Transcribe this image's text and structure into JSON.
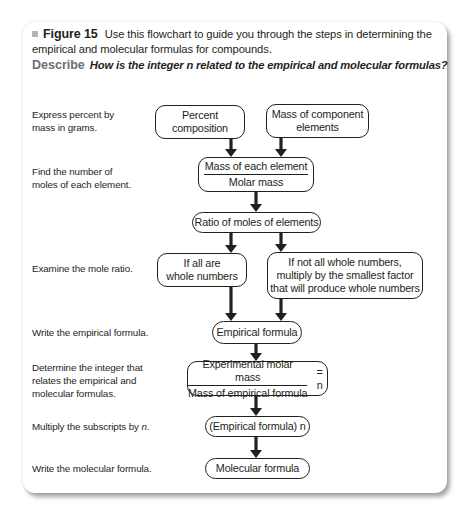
{
  "caption": {
    "figure_label": "Figure 15",
    "text": "Use this flowchart to guide you through the steps in determining the empirical and molecular formulas for compounds.",
    "describe_label": "Describe",
    "describe_question": "How is the integer n related to the empirical and molecular formulas?"
  },
  "steps": [
    {
      "line1": "Express percent by",
      "line2": "mass in grams.",
      "line3": ""
    },
    {
      "line1": "Find the number of",
      "line2": "moles of each element.",
      "line3": ""
    },
    {
      "line1": "Examine the mole ratio.",
      "line2": "",
      "line3": ""
    },
    {
      "line1": "Write the empirical formula.",
      "line2": "",
      "line3": ""
    },
    {
      "line1": "Determine the integer that",
      "line2": "relates the empirical and",
      "line3": "molecular formulas."
    },
    {
      "line1": "Multiply the subscripts by ",
      "line1_italic": "n",
      "line1_end": ".",
      "line2": "",
      "line3": ""
    },
    {
      "line1": "Write the molecular formula.",
      "line2": "",
      "line3": ""
    }
  ],
  "boxes": {
    "percent_composition": {
      "line1": "Percent",
      "line2": "composition"
    },
    "mass_components": {
      "line1": "Mass of component",
      "line2": "elements"
    },
    "moles_fraction": {
      "numerator": "Mass of each element",
      "denominator": "Molar mass"
    },
    "ratio": {
      "label": "Ratio of moles of elements"
    },
    "whole_numbers": {
      "line1": "If all are",
      "line2": "whole numbers"
    },
    "not_whole": {
      "line1": "If not all whole numbers,",
      "line2": "multiply by the smallest factor",
      "line3": "that will produce whole numbers"
    },
    "empirical": {
      "label": "Empirical formula"
    },
    "n_fraction": {
      "numerator": "Experimental molar mass",
      "denominator": "Mass of empirical formula",
      "equals": "= n"
    },
    "empirical_n": {
      "label": "(Empirical formula) n"
    },
    "molecular": {
      "label": "Molecular formula"
    }
  },
  "colors": {
    "text": "#231f20",
    "describe_label": "#6d6e71",
    "bullet": "#b5b5b5",
    "arrow": "#231f20"
  }
}
